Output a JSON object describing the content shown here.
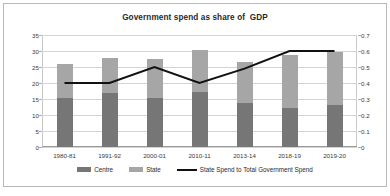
{
  "chart_data": {
    "type": "bar",
    "title": "Government spend as share of  GDP",
    "xlabel": "",
    "ylabel": "Per cent of GDP",
    "y2label": "",
    "categories": [
      "1980-81",
      "1991-92",
      "2000-01",
      "2010-11",
      "2013-14",
      "2018-19",
      "2019-20"
    ],
    "series": [
      {
        "name": "Centre",
        "type": "bar",
        "stack": "total",
        "color": "#767676",
        "axis": "left",
        "values": [
          15.3,
          16.9,
          15.3,
          17.2,
          13.8,
          12.2,
          13.1
        ]
      },
      {
        "name": "State",
        "type": "bar",
        "stack": "total",
        "color": "#a6a6a6",
        "axis": "left",
        "values": [
          10.6,
          10.9,
          12.2,
          13.1,
          12.8,
          16.6,
          16.6
        ]
      },
      {
        "name": "State Spend to Total Government Spend",
        "type": "line",
        "color": "#111111",
        "axis": "right",
        "values": [
          0.4,
          0.4,
          0.5,
          0.4,
          0.49,
          0.6,
          0.6
        ]
      }
    ],
    "totals": [
      25.9,
      27.8,
      27.5,
      30.3,
      26.6,
      28.8,
      29.7
    ],
    "ylim": [
      0,
      35
    ],
    "yticks": [
      "0",
      "5",
      "10",
      "15",
      "20",
      "25",
      "30",
      "35"
    ],
    "y2lim": [
      0,
      0.7
    ],
    "y2ticks": [
      "0",
      "0.1",
      "0.2",
      "0.3",
      "0.4",
      "0.5",
      "0.6",
      "0.7"
    ],
    "grid": true,
    "legend_position": "bottom"
  },
  "legend": {
    "items": [
      {
        "label": "Centre",
        "marker": "bar-swatch-dark"
      },
      {
        "label": "State",
        "marker": "bar-swatch-light"
      },
      {
        "label": "State Spend to Total Government Spend",
        "marker": "line-swatch-black"
      }
    ]
  },
  "colors": {
    "centre": "#767676",
    "state": "#a6a6a6",
    "line": "#111111",
    "grid": "#d4d4d4",
    "frame": "#b9b9b9",
    "text": "#2a2a2a"
  }
}
